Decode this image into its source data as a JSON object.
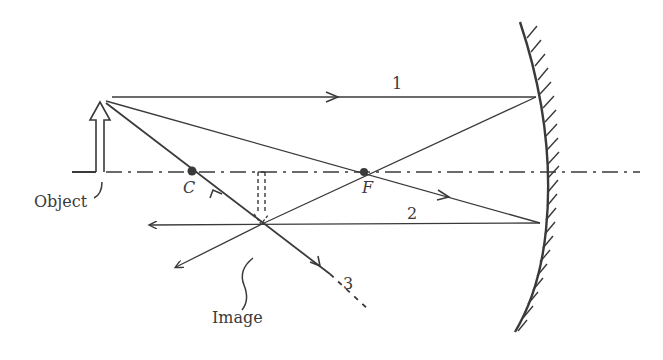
{
  "diagram": {
    "type": "concave-mirror-ray-diagram",
    "colors": {
      "ink": "#3a3a3a",
      "background": "#ffffff"
    },
    "labels": {
      "object": "Object",
      "image": "Image",
      "center_of_curvature": "C",
      "focal_point": "F",
      "ray_1": "1",
      "ray_2": "2",
      "ray_3": "3"
    },
    "elements": {
      "principal_axis": "dash-dot line",
      "mirror": "concave mirror with hatched back",
      "object_arrow": "upright hollow arrow",
      "image_arrow": "inverted dashed arrow",
      "rays": [
        {
          "id": "1",
          "description": "parallel to axis, reflects through F"
        },
        {
          "id": "2",
          "description": "through F, reflects parallel to axis"
        },
        {
          "id": "3",
          "description": "through C, reflects back on itself"
        }
      ]
    }
  }
}
